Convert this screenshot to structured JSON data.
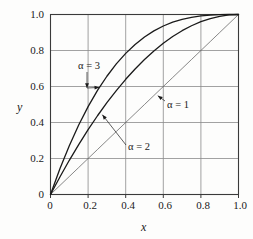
{
  "chart_data": {
    "type": "line",
    "title": "",
    "xlabel": "x",
    "ylabel": "y",
    "xlim": [
      0,
      1.0
    ],
    "ylim": [
      0,
      1.0
    ],
    "grid": true,
    "legend_position": "inline-annotations",
    "x_ticks": [
      "0",
      "0.2",
      "0.4",
      "0.6",
      "0.8",
      "1.0"
    ],
    "x_tick_values": [
      0,
      0.2,
      0.4,
      0.6,
      0.8,
      1.0
    ],
    "y_ticks": [
      "0",
      "0.2",
      "0.4",
      "0.6",
      "0.8",
      "1.0"
    ],
    "y_tick_values": [
      0,
      0.2,
      0.4,
      0.6,
      0.8,
      1.0
    ],
    "x": [
      0,
      0.05,
      0.1,
      0.15,
      0.2,
      0.25,
      0.3,
      0.35,
      0.4,
      0.45,
      0.5,
      0.55,
      0.6,
      0.65,
      0.7,
      0.75,
      0.8,
      0.85,
      0.9,
      0.95,
      1.0
    ],
    "series": [
      {
        "name": "alpha = 1",
        "label": "α = 1",
        "alpha": 1,
        "color": "#555555",
        "width": 0.7,
        "values": [
          0,
          0.05,
          0.1,
          0.15,
          0.2,
          0.25,
          0.3,
          0.35,
          0.4,
          0.45,
          0.5,
          0.55,
          0.6,
          0.65,
          0.7,
          0.75,
          0.8,
          0.85,
          0.9,
          0.95,
          1.0
        ]
      },
      {
        "name": "alpha = 2",
        "label": "α = 2",
        "alpha": 2,
        "color": "#1a1a1a",
        "width": 1.3,
        "values": [
          0,
          0.0975,
          0.19,
          0.2775,
          0.36,
          0.4375,
          0.51,
          0.5775,
          0.64,
          0.6975,
          0.75,
          0.7975,
          0.84,
          0.8775,
          0.91,
          0.9375,
          0.96,
          0.9775,
          0.99,
          0.9975,
          1.0
        ]
      },
      {
        "name": "alpha = 3",
        "label": "α = 3",
        "alpha": 3,
        "color": "#1a1a1a",
        "width": 1.3,
        "values": [
          0,
          0.142625,
          0.271,
          0.385875,
          0.488,
          0.578125,
          0.657,
          0.725375,
          0.784,
          0.833625,
          0.875,
          0.908875,
          0.936,
          0.957125,
          0.973,
          0.984375,
          0.992,
          0.996625,
          0.999,
          0.999875,
          1.0
        ]
      }
    ],
    "annotations": [
      {
        "text": "α = 3",
        "target_series": "alpha = 3",
        "target_x": 0.26,
        "target_y": 0.595
      },
      {
        "text": "α = 1",
        "target_series": "alpha = 1",
        "target_x": 0.56,
        "target_y": 0.56
      },
      {
        "text": "α = 2",
        "target_series": "alpha = 2",
        "target_x": 0.265,
        "target_y": 0.46
      }
    ]
  },
  "axis": {
    "x_title": "x",
    "y_title": "y"
  },
  "labels": {
    "alpha3": "α = 3",
    "alpha2": "α = 2",
    "alpha1": "α = 1"
  },
  "colors": {
    "frame": "#3a3a3a",
    "grid": "#8a8a8a",
    "curve": "#1a1a1a",
    "diagonal": "#555555",
    "background": "#fdfdfc"
  }
}
